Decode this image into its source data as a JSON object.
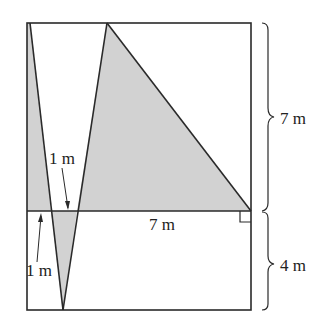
{
  "diagram": {
    "colors": {
      "line": "#2a2a2a",
      "shade": "#d2d2d2",
      "background": "#ffffff"
    },
    "labels": {
      "upper_height": "7 m",
      "lower_height": "4 m",
      "base_width": "7 m",
      "gap_upper": "1 m",
      "gap_lower": "1 m"
    },
    "features": {
      "right_angle_marker": true,
      "braces": [
        "upper",
        "lower"
      ]
    }
  }
}
